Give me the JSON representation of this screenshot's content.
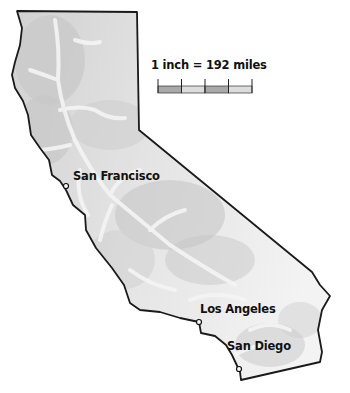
{
  "map": {
    "region": "California",
    "scale": {
      "label": "1 inch = 192 miles",
      "segments": 4,
      "segment_colors": [
        "#a9a9a9",
        "#dcdcdc",
        "#a9a9a9",
        "#dcdcdc"
      ]
    },
    "cities": [
      {
        "name": "San Francisco",
        "marker": "open-circle"
      },
      {
        "name": "Los Angeles",
        "marker": "open-circle"
      },
      {
        "name": "San Diego",
        "marker": "open-circle"
      }
    ],
    "colors": {
      "outline": "#1a1a1a",
      "fill_light": "#f0f0f0",
      "fill_dark": "#c4c4c4",
      "background": "#ffffff"
    }
  }
}
